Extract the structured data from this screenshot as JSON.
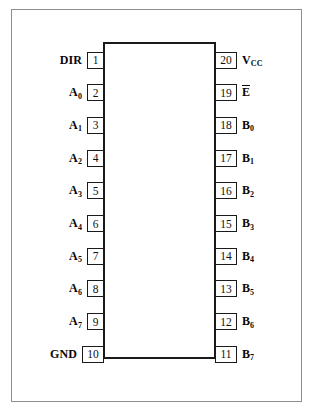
{
  "diagram": {
    "type": "ic-pinout",
    "package": "20-pin DIP",
    "colors": {
      "page_background": "#ffffff",
      "frame_border": "#8d8d8d",
      "chip_outline": "#1a1a1a",
      "text": "#080808"
    }
  },
  "pins": {
    "left": [
      {
        "number": "1",
        "label": "DIR",
        "label_base": "DIR",
        "subscript": "",
        "overbar": false,
        "wide": false
      },
      {
        "number": "2",
        "label": "A0",
        "label_base": "A",
        "subscript": "0",
        "overbar": false,
        "wide": false
      },
      {
        "number": "3",
        "label": "A1",
        "label_base": "A",
        "subscript": "1",
        "overbar": false,
        "wide": false
      },
      {
        "number": "4",
        "label": "A2",
        "label_base": "A",
        "subscript": "2",
        "overbar": false,
        "wide": false
      },
      {
        "number": "5",
        "label": "A3",
        "label_base": "A",
        "subscript": "3",
        "overbar": false,
        "wide": false
      },
      {
        "number": "6",
        "label": "A4",
        "label_base": "A",
        "subscript": "4",
        "overbar": false,
        "wide": false
      },
      {
        "number": "7",
        "label": "A5",
        "label_base": "A",
        "subscript": "5",
        "overbar": false,
        "wide": false
      },
      {
        "number": "8",
        "label": "A6",
        "label_base": "A",
        "subscript": "6",
        "overbar": false,
        "wide": false
      },
      {
        "number": "9",
        "label": "A7",
        "label_base": "A",
        "subscript": "7",
        "overbar": false,
        "wide": false
      },
      {
        "number": "10",
        "label": "GND",
        "label_base": "GND",
        "subscript": "",
        "overbar": false,
        "wide": true
      }
    ],
    "right": [
      {
        "number": "20",
        "label": "VCC",
        "label_base": "V",
        "subscript": "CC",
        "overbar": false,
        "wide": true
      },
      {
        "number": "19",
        "label": "E",
        "label_base": "E",
        "subscript": "",
        "overbar": true,
        "wide": true
      },
      {
        "number": "18",
        "label": "B0",
        "label_base": "B",
        "subscript": "0",
        "overbar": false,
        "wide": true
      },
      {
        "number": "17",
        "label": "B1",
        "label_base": "B",
        "subscript": "1",
        "overbar": false,
        "wide": true
      },
      {
        "number": "16",
        "label": "B2",
        "label_base": "B",
        "subscript": "2",
        "overbar": false,
        "wide": true
      },
      {
        "number": "15",
        "label": "B3",
        "label_base": "B",
        "subscript": "3",
        "overbar": false,
        "wide": true
      },
      {
        "number": "14",
        "label": "B4",
        "label_base": "B",
        "subscript": "4",
        "overbar": false,
        "wide": true
      },
      {
        "number": "13",
        "label": "B5",
        "label_base": "B",
        "subscript": "5",
        "overbar": false,
        "wide": true
      },
      {
        "number": "12",
        "label": "B6",
        "label_base": "B",
        "subscript": "6",
        "overbar": false,
        "wide": true
      },
      {
        "number": "11",
        "label": "B7",
        "label_base": "B",
        "subscript": "7",
        "overbar": false,
        "wide": true
      }
    ]
  },
  "geometry": {
    "first_pin_center_y": 60,
    "pin_pitch_y": 32.7
  }
}
